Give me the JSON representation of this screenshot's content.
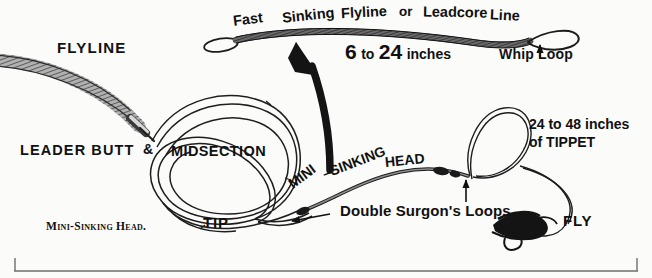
{
  "diagram": {
    "caption": "Mini-Sinking Head.",
    "ink_color": "#111111",
    "paper_color": "#fbfbfa",
    "headline_words": [
      "Fast",
      "Sinking",
      "Flyline",
      "or",
      "Leadcore",
      "Line"
    ],
    "measurement": {
      "value_min": "6",
      "joiner": "to",
      "value_max": "24",
      "unit": "inches"
    },
    "tippet_note": {
      "line1": "24 to 48 inches",
      "line2": "of TIPPET"
    },
    "mini_sinking_head_arc": [
      "MINI",
      "–SINKING",
      "HEAD"
    ],
    "labels": {
      "flyline": "FLYLINE",
      "leader_butt": "LEADER BUTT",
      "ampersand": "&",
      "midsection": "MIDSECTION",
      "tip": "TIP",
      "whip_loop": "Whip Loop",
      "fly": "FLY",
      "double_surgeons_loops": "Double Surgon's Loops"
    }
  }
}
